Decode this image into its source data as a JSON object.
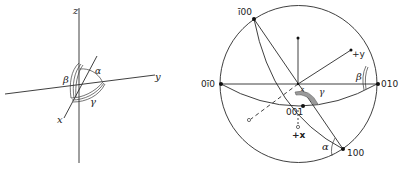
{
  "left_figure": {
    "axes": {
      "z_label": "z",
      "y_label": "y",
      "x_label": "x"
    },
    "angles": {
      "alpha_label": "α",
      "beta_label": "β",
      "gamma_label": "γ"
    }
  },
  "right_figure": {
    "poles": {
      "bar100_label": "ī00",
      "zero_bar1_zero_label": "0ī0",
      "zero_one_zero_label": "010",
      "one00_label": "100",
      "zero01_label": "001"
    },
    "directions": {
      "plus_y_label": "+y",
      "plus_x_label": "+x",
      "z_small_label": "z"
    },
    "angles": {
      "alpha_label": "α",
      "beta_label": "β",
      "gamma_label": "γ"
    }
  },
  "colors": {
    "line": "#2a2a2a",
    "background": "#ffffff"
  }
}
